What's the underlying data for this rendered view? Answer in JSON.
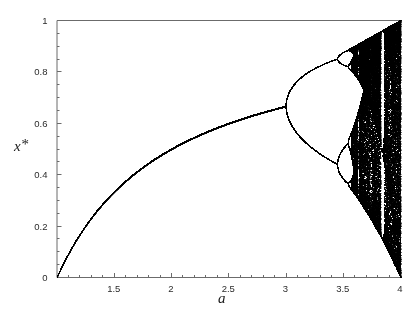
{
  "figure": {
    "background_color": "#ffffff",
    "ink_color": "#000000",
    "axis_color": "#6b6b6b"
  },
  "axes": {
    "x_label": "a",
    "y_label_base": "x",
    "y_label_superscript": "*",
    "x_ticks": [
      {
        "value": 1.5,
        "label": "1.5"
      },
      {
        "value": 2.0,
        "label": "2"
      },
      {
        "value": 2.5,
        "label": "2.5"
      },
      {
        "value": 3.0,
        "label": "3"
      },
      {
        "value": 3.5,
        "label": "3.5"
      },
      {
        "value": 4.0,
        "label": "4"
      }
    ],
    "y_ticks": [
      {
        "value": 0.0,
        "label": "0"
      },
      {
        "value": 0.2,
        "label": "0.2"
      },
      {
        "value": 0.4,
        "label": "0.4"
      },
      {
        "value": 0.6,
        "label": "0.6"
      },
      {
        "value": 0.8,
        "label": "0.8"
      },
      {
        "value": 1.0,
        "label": "1"
      }
    ],
    "x_minor_tick_step": 0.1,
    "y_minor_tick_step": 0.05
  },
  "chart_data": {
    "type": "scatter",
    "title": "",
    "subtitle": "",
    "xlabel": "a",
    "ylabel": "x*",
    "xlim": [
      1.0,
      4.0
    ],
    "ylim": [
      0.0,
      1.0
    ],
    "grid": false,
    "legend": null,
    "annotations": [],
    "map": "x_{n+1} = a * x_n * (1 - x_n)",
    "iterate_settings": {
      "transient_iterations": 300,
      "plotted_iterations": 260,
      "x_initial": 0.35,
      "a_samples": 1400
    },
    "key_features": [
      {
        "name": "fixed-point-branch",
        "a_range": [
          1.0,
          3.0
        ],
        "x_formula": "1 - 1/a",
        "x_at_a_start": 0.0,
        "x_at_a_end": 0.6667
      },
      {
        "name": "period-2-onset",
        "a": 3.0,
        "x": 0.6667
      },
      {
        "name": "period-4-onset",
        "a": 3.449,
        "x_upper": 0.8499,
        "x_lower": 0.44
      },
      {
        "name": "period-8-onset",
        "a": 3.544,
        "x_values": [
          0.883,
          0.824,
          0.506,
          0.372
        ]
      },
      {
        "name": "accumulation-point",
        "a": 3.5699,
        "label": "onset of chaos"
      },
      {
        "name": "period-3-window",
        "a_range": [
          3.828,
          3.857
        ]
      },
      {
        "name": "period-5-window",
        "a_range": [
          3.738,
          3.745
        ]
      },
      {
        "name": "period-6-window",
        "a_range": [
          3.626,
          3.635
        ]
      },
      {
        "name": "chaotic-band-top",
        "a": 4.0,
        "x": 1.0
      },
      {
        "name": "chaotic-band-bottom",
        "a": 4.0,
        "x": 0.0
      }
    ],
    "reference_points": [
      {
        "a": 1.0,
        "x": 0.0
      },
      {
        "a": 1.5,
        "x": 0.3333
      },
      {
        "a": 2.0,
        "x": 0.5
      },
      {
        "a": 2.5,
        "x": 0.6
      },
      {
        "a": 3.0,
        "x": 0.6667
      },
      {
        "a": 3.2,
        "x_values": [
          0.7995,
          0.513
        ]
      },
      {
        "a": 3.4,
        "x_values": [
          0.842,
          0.452
        ]
      },
      {
        "a": 3.5,
        "x_values": [
          0.875,
          0.8269,
          0.5009,
          0.3828
        ]
      }
    ]
  }
}
